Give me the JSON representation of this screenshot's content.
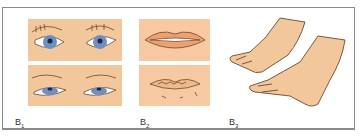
{
  "figure": {
    "panels": [
      {
        "id": "B1",
        "label": "B",
        "subscript": "1",
        "content": "eyes-comparison"
      },
      {
        "id": "B2",
        "label": "B",
        "subscript": "2",
        "content": "lips-comparison"
      },
      {
        "id": "B3",
        "label": "B",
        "subscript": "3",
        "content": "hands"
      }
    ],
    "colors": {
      "skin": "#f2c79c",
      "lip_bg": "#f7c9a3",
      "iris": "#6f8fc4",
      "outline": "#6b4a2e",
      "border": "#8a8a8a"
    }
  }
}
